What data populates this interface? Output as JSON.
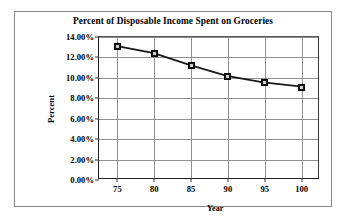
{
  "chart_data": {
    "type": "line",
    "title": "Percent of Disposable Income Spent on Groceries",
    "xlabel": "Year",
    "ylabel": "Percent",
    "x": [
      75,
      80,
      85,
      90,
      95,
      100
    ],
    "categories": [
      "75",
      "80",
      "85",
      "90",
      "95",
      "100"
    ],
    "values": [
      13.1,
      12.4,
      11.2,
      10.15,
      9.5,
      9.1
    ],
    "series": [
      {
        "name": "Percent of Disposable Income Spent on Groceries",
        "values": [
          13.1,
          12.4,
          11.2,
          10.15,
          9.5,
          9.1
        ]
      }
    ],
    "ylim": [
      0,
      14
    ],
    "xlim": [
      72.5,
      102.5
    ],
    "ytick_labels": [
      "0.00%",
      "2.00%",
      "4.00%",
      "6.00%",
      "8.00%",
      "10.00%",
      "12.00%",
      "14.00%"
    ],
    "ytick_values": [
      0,
      2,
      4,
      6,
      8,
      10,
      12,
      14
    ],
    "xtick_labels": [
      "75",
      "80",
      "85",
      "90",
      "95",
      "100"
    ],
    "grid": "both",
    "legend": "none",
    "marker": "square",
    "line_color": "#1a1a1a",
    "grid_color": "#8f8f8f",
    "background": "#ffffff"
  }
}
